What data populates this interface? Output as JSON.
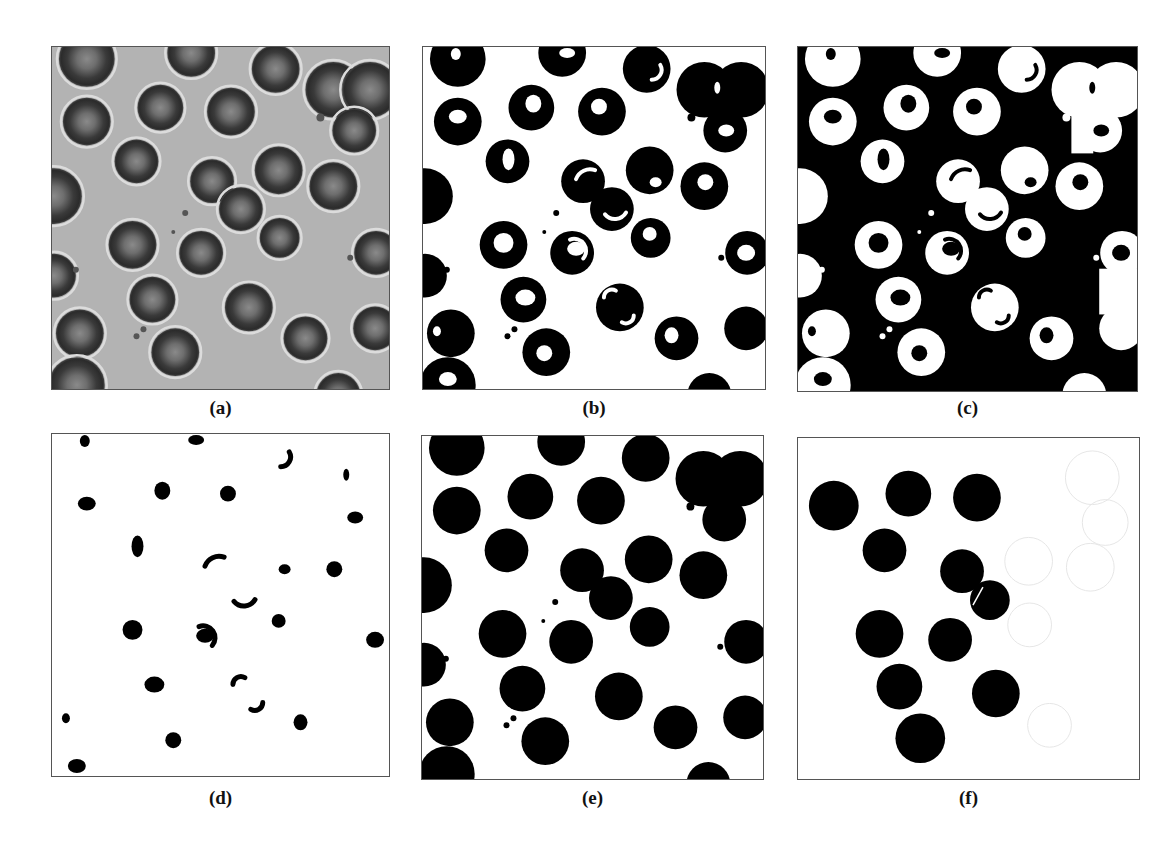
{
  "figure": {
    "panels": [
      {
        "id": "a",
        "label": "(a)",
        "kind": "micrograph",
        "box": {
          "x": 51,
          "y": 46,
          "w": 339,
          "h": 344
        },
        "caption_y": 397
      },
      {
        "id": "b",
        "label": "(b)",
        "kind": "binary-rings",
        "box": {
          "x": 422,
          "y": 46,
          "w": 344,
          "h": 344
        },
        "caption_y": 397
      },
      {
        "id": "c",
        "label": "(c)",
        "kind": "inverted-rings",
        "box": {
          "x": 797,
          "y": 46,
          "w": 341,
          "h": 346
        },
        "caption_y": 397
      },
      {
        "id": "d",
        "label": "(d)",
        "kind": "centers-only",
        "box": {
          "x": 51,
          "y": 433,
          "w": 339,
          "h": 344
        },
        "caption_y": 787
      },
      {
        "id": "e",
        "label": "(e)",
        "kind": "filled-disks",
        "box": {
          "x": 421,
          "y": 435,
          "w": 343,
          "h": 345
        },
        "caption_y": 787
      },
      {
        "id": "f",
        "label": "(f)",
        "kind": "selected-disks",
        "box": {
          "x": 797,
          "y": 437,
          "w": 343,
          "h": 343
        },
        "caption_y": 787
      }
    ],
    "colors": {
      "micrograph_bg": "#b3b3b3",
      "cell_rim": "#2b2b2b",
      "cell_center": "#6e6e6e",
      "halo": "#dcdcdc",
      "foreground": "#000000",
      "background": "#ffffff",
      "ghost_outline": "#e6e6e6",
      "border": "#555555"
    },
    "cells": [
      {
        "x": 35,
        "y": 12,
        "r": 28
      },
      {
        "x": 140,
        "y": 6,
        "r": 24
      },
      {
        "x": 225,
        "y": 22,
        "r": 24
      },
      {
        "x": 283,
        "y": 43,
        "r": 28
      },
      {
        "x": 320,
        "y": 43,
        "r": 28
      },
      {
        "x": 35,
        "y": 75,
        "r": 24
      },
      {
        "x": 109,
        "y": 61,
        "r": 23
      },
      {
        "x": 180,
        "y": 65,
        "r": 24
      },
      {
        "x": 304,
        "y": 84,
        "r": 22
      },
      {
        "x": 85,
        "y": 115,
        "r": 22
      },
      {
        "x": 161,
        "y": 135,
        "r": 22
      },
      {
        "x": 228,
        "y": 124,
        "r": 24
      },
      {
        "x": 283,
        "y": 140,
        "r": 24
      },
      {
        "x": 190,
        "y": 163,
        "r": 22
      },
      {
        "x": 2,
        "y": 150,
        "r": 28
      },
      {
        "x": 81,
        "y": 199,
        "r": 24
      },
      {
        "x": 150,
        "y": 207,
        "r": 22
      },
      {
        "x": 229,
        "y": 192,
        "r": 20
      },
      {
        "x": 326,
        "y": 207,
        "r": 22
      },
      {
        "x": 2,
        "y": 230,
        "r": 22
      },
      {
        "x": 101,
        "y": 254,
        "r": 23
      },
      {
        "x": 198,
        "y": 262,
        "r": 24
      },
      {
        "x": 255,
        "y": 293,
        "r": 22
      },
      {
        "x": 325,
        "y": 283,
        "r": 22
      },
      {
        "x": 28,
        "y": 288,
        "r": 24
      },
      {
        "x": 124,
        "y": 307,
        "r": 24
      },
      {
        "x": 25,
        "y": 340,
        "r": 28
      },
      {
        "x": 288,
        "y": 350,
        "r": 22
      }
    ],
    "debris": [
      {
        "x": 270,
        "y": 71,
        "r": 4
      },
      {
        "x": 134,
        "y": 167,
        "r": 3
      },
      {
        "x": 122,
        "y": 186,
        "r": 2
      },
      {
        "x": 24,
        "y": 224,
        "r": 3
      },
      {
        "x": 300,
        "y": 212,
        "r": 3
      },
      {
        "x": 85,
        "y": 291,
        "r": 3
      },
      {
        "x": 92,
        "y": 284,
        "r": 3
      }
    ],
    "selected_cells": [
      {
        "x": 36,
        "y": 68,
        "r": 25
      },
      {
        "x": 111,
        "y": 56,
        "r": 23
      },
      {
        "x": 180,
        "y": 60,
        "r": 24
      },
      {
        "x": 87,
        "y": 113,
        "r": 22
      },
      {
        "x": 165,
        "y": 134,
        "r": 22
      },
      {
        "x": 193,
        "y": 163,
        "r": 20
      },
      {
        "x": 82,
        "y": 197,
        "r": 24
      },
      {
        "x": 153,
        "y": 203,
        "r": 22
      },
      {
        "x": 102,
        "y": 250,
        "r": 23
      },
      {
        "x": 199,
        "y": 257,
        "r": 24
      },
      {
        "x": 123,
        "y": 302,
        "r": 25
      }
    ],
    "ghost_cells": [
      {
        "x": 296,
        "y": 40,
        "r": 27
      },
      {
        "x": 309,
        "y": 85,
        "r": 23
      },
      {
        "x": 232,
        "y": 124,
        "r": 24
      },
      {
        "x": 294,
        "y": 130,
        "r": 24
      },
      {
        "x": 233,
        "y": 188,
        "r": 22
      },
      {
        "x": 253,
        "y": 289,
        "r": 22
      }
    ],
    "center_blobs": [
      {
        "x": 35,
        "y": 70,
        "rx": 9,
        "ry": 7
      },
      {
        "x": 111,
        "y": 57,
        "rx": 8,
        "ry": 9
      },
      {
        "x": 177,
        "y": 60,
        "rx": 8,
        "ry": 8
      },
      {
        "x": 86,
        "y": 113,
        "rx": 6,
        "ry": 11
      },
      {
        "x": 234,
        "y": 136,
        "rx": 6,
        "ry": 5
      },
      {
        "x": 284,
        "y": 136,
        "rx": 8,
        "ry": 8
      },
      {
        "x": 305,
        "y": 84,
        "rx": 8,
        "ry": 6
      },
      {
        "x": 81,
        "y": 197,
        "rx": 10,
        "ry": 10
      },
      {
        "x": 154,
        "y": 203,
        "rx": 9,
        "ry": 7
      },
      {
        "x": 228,
        "y": 188,
        "rx": 7,
        "ry": 7
      },
      {
        "x": 103,
        "y": 252,
        "rx": 10,
        "ry": 8
      },
      {
        "x": 33,
        "y": 7,
        "rx": 5,
        "ry": 6
      },
      {
        "x": 145,
        "y": 6,
        "rx": 8,
        "ry": 5
      },
      {
        "x": 122,
        "y": 308,
        "rx": 8,
        "ry": 8
      },
      {
        "x": 25,
        "y": 334,
        "rx": 9,
        "ry": 7
      },
      {
        "x": 250,
        "y": 290,
        "rx": 7,
        "ry": 8
      },
      {
        "x": 325,
        "y": 207,
        "rx": 9,
        "ry": 8
      },
      {
        "x": 14,
        "y": 286,
        "rx": 4,
        "ry": 5
      },
      {
        "x": 296,
        "y": 41,
        "rx": 3,
        "ry": 6
      }
    ],
    "crescents": [
      {
        "x": 168,
        "y": 138,
        "r": 15,
        "start": 200,
        "end": 290
      },
      {
        "x": 193,
        "y": 160,
        "r": 13,
        "start": 30,
        "end": 140
      },
      {
        "x": 152,
        "y": 205,
        "r": 12,
        "start": 250,
        "end": 40
      },
      {
        "x": 190,
        "y": 252,
        "r": 8,
        "start": 180,
        "end": 300
      },
      {
        "x": 204,
        "y": 270,
        "r": 8,
        "start": 0,
        "end": 120
      },
      {
        "x": 230,
        "y": 23,
        "r": 10,
        "start": 330,
        "end": 90
      }
    ],
    "mask_rects_c": [
      {
        "x": 275,
        "y": 52,
        "w": 22,
        "h": 55
      },
      {
        "x": 303,
        "y": 223,
        "w": 38,
        "h": 46
      }
    ]
  }
}
